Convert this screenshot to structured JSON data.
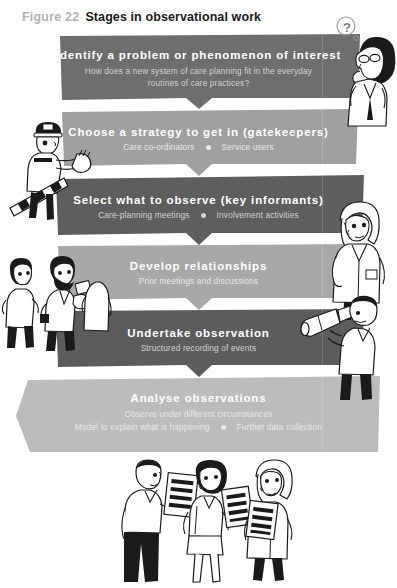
{
  "figure": {
    "label": "Figure 22",
    "title": "Stages in observational work"
  },
  "colors": {
    "band_dark": "#6e6e6e",
    "band_mid": "#9a9a9a",
    "band_darker": "#5a5a5a",
    "band_light": "#b5b5b5",
    "band_lightest": "#c4c4c4",
    "title_text": "#1a1a1a",
    "label_text": "#b3b3b3",
    "band_title_text": "#ffffff",
    "band_sub_text": "#d9d9d9",
    "ink": "#1a1a1a",
    "page_background": "#ffffff"
  },
  "stages": [
    {
      "id": "identify-problem",
      "title": "Identify a problem or phenomenon of interest",
      "subtitle_lines": [
        "How does a new system of care planning fit in the everyday",
        "routines of care practices?"
      ],
      "subtitle_pairs": [],
      "fill": "#6e6e6e",
      "tone": "dark"
    },
    {
      "id": "choose-strategy",
      "title": "Choose a strategy to get in (gatekeepers)",
      "subtitle_lines": [],
      "subtitle_pairs": [
        "Care co-ordinators",
        "Service users"
      ],
      "fill": "#a0a0a0",
      "tone": "light"
    },
    {
      "id": "select-what-to-observe",
      "title": "Select what to observe (key informants)",
      "subtitle_lines": [],
      "subtitle_pairs": [
        "Care-planning meetings",
        "Involvement activities"
      ],
      "fill": "#5e5e5e",
      "tone": "dark"
    },
    {
      "id": "develop-relationships",
      "title": "Develop relationships",
      "subtitle_lines": [
        "Prior meetings and discussions"
      ],
      "subtitle_pairs": [],
      "fill": "#a8a8a8",
      "tone": "light"
    },
    {
      "id": "undertake-observation",
      "title": "Undertake observation",
      "subtitle_lines": [
        "Structured recording of events"
      ],
      "subtitle_pairs": [],
      "fill": "#5c5c5c",
      "tone": "dark"
    },
    {
      "id": "analyse-observations",
      "title": "Analyse observations",
      "subtitle_lines": [
        "Observe under different circumstances"
      ],
      "subtitle_pairs": [
        "Model to explain what is happening",
        "Further data collection"
      ],
      "fill": "#bcbcbc",
      "tone": "light"
    }
  ],
  "illustrations": [
    {
      "id": "thinking-woman-top-right",
      "caption": "?"
    },
    {
      "id": "gatekeeper-guard-left",
      "caption": ""
    },
    {
      "id": "nurse-right",
      "caption": ""
    },
    {
      "id": "meeting-group-left",
      "caption": ""
    },
    {
      "id": "telescope-man-right",
      "caption": ""
    },
    {
      "id": "documents-group-bottom",
      "caption": ""
    }
  ]
}
